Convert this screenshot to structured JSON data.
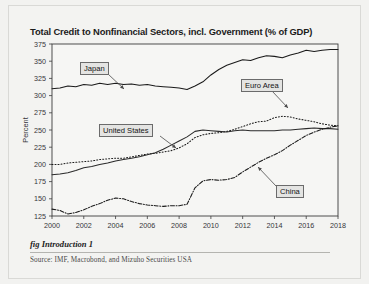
{
  "figure": {
    "title": "Total Credit to Nonfinancial Sectors, incl. Government (% of GDP)",
    "caption": "fig Introduction 1",
    "source": "Source:  IMF, Macrobond, and Mizuho Securities USA"
  },
  "labels": {
    "japan": "Japan",
    "euro_area": "Euro Area",
    "united_states": "United States",
    "china": "China"
  },
  "chart_data": {
    "type": "line",
    "title": "Total Credit to Nonfinancial Sectors, incl. Government (% of GDP)",
    "xlabel": "",
    "ylabel": "Percent",
    "xlim": [
      2000,
      2018
    ],
    "ylim": [
      125,
      375
    ],
    "yticks": [
      125,
      150,
      175,
      200,
      225,
      250,
      275,
      300,
      325,
      350,
      375
    ],
    "xticks": [
      2000,
      2002,
      2004,
      2006,
      2008,
      2010,
      2012,
      2014,
      2016,
      2018
    ],
    "grid": false,
    "legend": "inline-callout-labels",
    "series": [
      {
        "name": "Japan",
        "style": "solid",
        "color": "#1a1a1a",
        "x": [
          2000,
          2000.5,
          2001,
          2001.5,
          2002,
          2002.5,
          2003,
          2003.5,
          2004,
          2004.5,
          2005,
          2005.5,
          2006,
          2006.5,
          2007,
          2007.5,
          2008,
          2008.5,
          2009,
          2009.5,
          2010,
          2010.5,
          2011,
          2011.5,
          2012,
          2012.5,
          2013,
          2013.5,
          2014,
          2014.5,
          2015,
          2015.5,
          2016,
          2016.5,
          2017,
          2017.5,
          2018
        ],
        "values": [
          310,
          311,
          314,
          313,
          316,
          315,
          318,
          316,
          318,
          316,
          317,
          315,
          316,
          314,
          313,
          312,
          311,
          309,
          314,
          320,
          330,
          338,
          344,
          348,
          352,
          351,
          355,
          358,
          357,
          355,
          359,
          362,
          366,
          364,
          366,
          367,
          367
        ]
      },
      {
        "name": "Euro Area",
        "style": "dotted",
        "color": "#1a1a1a",
        "x": [
          2000,
          2000.5,
          2001,
          2001.5,
          2002,
          2002.5,
          2003,
          2003.5,
          2004,
          2004.5,
          2005,
          2005.5,
          2006,
          2006.5,
          2007,
          2007.5,
          2008,
          2008.5,
          2009,
          2009.5,
          2010,
          2010.5,
          2011,
          2011.5,
          2012,
          2012.5,
          2013,
          2013.5,
          2014,
          2014.5,
          2015,
          2015.5,
          2016,
          2016.5,
          2017,
          2017.5,
          2018
        ],
        "values": [
          200,
          200,
          202,
          203,
          204,
          205,
          207,
          208,
          209,
          209,
          211,
          213,
          215,
          216,
          218,
          220,
          224,
          230,
          239,
          243,
          245,
          246,
          248,
          251,
          255,
          259,
          262,
          263,
          268,
          270,
          269,
          266,
          264,
          262,
          259,
          257,
          256
        ]
      },
      {
        "name": "United States",
        "style": "solid",
        "color": "#2a2a2a",
        "x": [
          2000,
          2000.5,
          2001,
          2001.5,
          2002,
          2002.5,
          2003,
          2003.5,
          2004,
          2004.5,
          2005,
          2005.5,
          2006,
          2006.5,
          2007,
          2007.5,
          2008,
          2008.5,
          2009,
          2009.5,
          2010,
          2010.5,
          2011,
          2011.5,
          2012,
          2012.5,
          2013,
          2013.5,
          2014,
          2014.5,
          2015,
          2015.5,
          2016,
          2016.5,
          2017,
          2017.5,
          2018
        ],
        "values": [
          185,
          186,
          188,
          191,
          195,
          197,
          200,
          202,
          205,
          207,
          209,
          211,
          214,
          217,
          222,
          228,
          234,
          240,
          248,
          250,
          249,
          248,
          247,
          249,
          250,
          249,
          249,
          249,
          249,
          250,
          250,
          251,
          252,
          253,
          252,
          252,
          251
        ]
      },
      {
        "name": "China",
        "style": "dashdot",
        "color": "#1a1a1a",
        "x": [
          2000,
          2000.5,
          2001,
          2001.5,
          2002,
          2002.5,
          2003,
          2003.5,
          2004,
          2004.5,
          2005,
          2005.5,
          2006,
          2006.5,
          2007,
          2007.5,
          2008,
          2008.5,
          2009,
          2009.5,
          2010,
          2010.5,
          2011,
          2011.5,
          2012,
          2012.5,
          2013,
          2013.5,
          2014,
          2014.5,
          2015,
          2015.5,
          2016,
          2016.5,
          2017,
          2017.5,
          2018
        ],
        "values": [
          135,
          133,
          128,
          130,
          134,
          139,
          143,
          148,
          151,
          150,
          146,
          143,
          141,
          140,
          139,
          140,
          140,
          142,
          166,
          176,
          178,
          177,
          178,
          181,
          189,
          196,
          203,
          209,
          214,
          220,
          228,
          235,
          242,
          247,
          251,
          254,
          256
        ]
      }
    ]
  }
}
